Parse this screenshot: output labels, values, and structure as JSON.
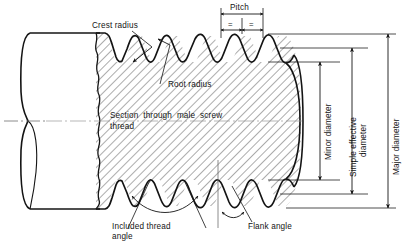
{
  "figure": {
    "type": "engineering-section-drawing"
  },
  "labels": {
    "crest_radius": "Crest radius",
    "root_radius": "Root radius",
    "section_line1": "Section  through  male  screw",
    "section_line2": "thread",
    "pitch": "Pitch",
    "half_pitch_mark": "=",
    "minor_diameter": "Minor diameter",
    "simple_effective_line1": "Simple effective",
    "simple_effective_line2": "diameter",
    "major_diameter": "Major diameter",
    "included_thread_line1": "Included thread",
    "included_thread_line2": "angle",
    "flank_angle": "Flank angle"
  },
  "colors": {
    "ink": "#141414",
    "hatch": "#3a3a3a",
    "thin_line": "#555555",
    "centerline": "#6e6e6e",
    "background": "#ffffff"
  },
  "geometry": {
    "thread_count": 5,
    "pitch_span_px": 42,
    "crest_y_top": 36,
    "root_y_top": 62,
    "crest_y_bottom": 186,
    "root_y_bottom": 160,
    "shaft_left_x": 20,
    "break_line_x": 96,
    "section_right_x": 300
  }
}
